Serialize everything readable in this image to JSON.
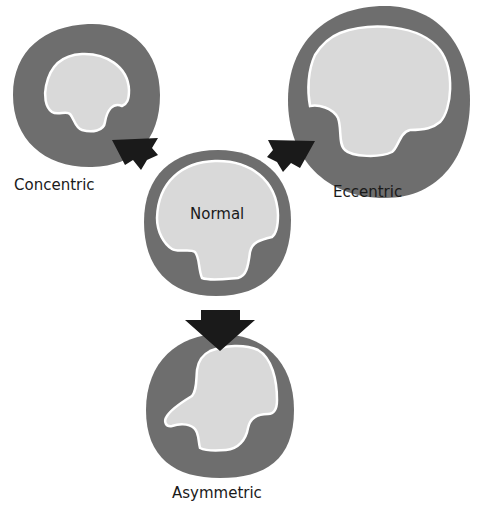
{
  "diagram": {
    "colors": {
      "wall": "#6e6e6e",
      "lumen": "#d9d9d9",
      "outline": "#ffffff",
      "arrow": "#1a1a1a"
    },
    "nodes": [
      {
        "id": "concentric",
        "label": "Concentric"
      },
      {
        "id": "eccentric",
        "label": "Eccentric"
      },
      {
        "id": "normal",
        "label": "Normal"
      },
      {
        "id": "asymmetric",
        "label": "Asymmetric"
      }
    ],
    "edges": [
      {
        "from": "normal",
        "to": "concentric",
        "style": "block-arrow"
      },
      {
        "from": "normal",
        "to": "eccentric",
        "style": "block-arrow"
      },
      {
        "from": "normal",
        "to": "asymmetric",
        "style": "block-arrow"
      }
    ]
  }
}
